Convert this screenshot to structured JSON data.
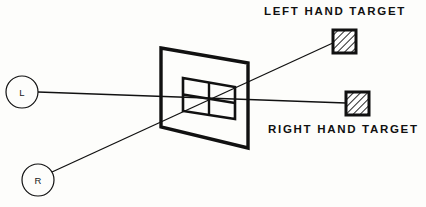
{
  "figure": {
    "type": "line-diagram",
    "background_color": "#fdfdfb",
    "ink_color": "#111111"
  },
  "labels": {
    "left_hand_target": "LEFT HAND TARGET",
    "right_hand_target": "RIGHT HAND TARGET"
  },
  "eyes": [
    {
      "id": "left-eye",
      "letter": "L",
      "center_x": 22,
      "center_y": 92,
      "radius": 16
    },
    {
      "id": "right-eye",
      "letter": "R",
      "center_x": 38,
      "center_y": 180,
      "radius": 16
    }
  ],
  "screen": {
    "name": "viewing-screen",
    "outer_points": "161,48 248,63 248,148 161,127",
    "inner_points": "183,78 235,87 235,119 183,111",
    "crosshair_vertical": {
      "x1": 209,
      "y1": 82,
      "x2": 209,
      "y2": 115
    },
    "crosshair_horizontal": {
      "x1": 183,
      "y1": 95,
      "x2": 235,
      "y2": 103
    }
  },
  "targets": [
    {
      "id": "left-hand-target",
      "x": 333,
      "y": 30,
      "size": 23,
      "hatch": "diagonal-45",
      "border_color": "#111111"
    },
    {
      "id": "right-hand-target",
      "x": 346,
      "y": 92,
      "size": 23,
      "hatch": "diagonal-45",
      "border_color": "#111111"
    }
  ],
  "sight_lines": [
    {
      "id": "left-eye-sightline",
      "from": "L",
      "to": "RIGHT HAND TARGET",
      "x1": 38,
      "y1": 92,
      "x2": 346,
      "y2": 103
    },
    {
      "id": "right-eye-sightline",
      "from": "R",
      "to": "LEFT HAND TARGET",
      "x1": 52,
      "y1": 172,
      "x2": 335,
      "y2": 42
    }
  ]
}
